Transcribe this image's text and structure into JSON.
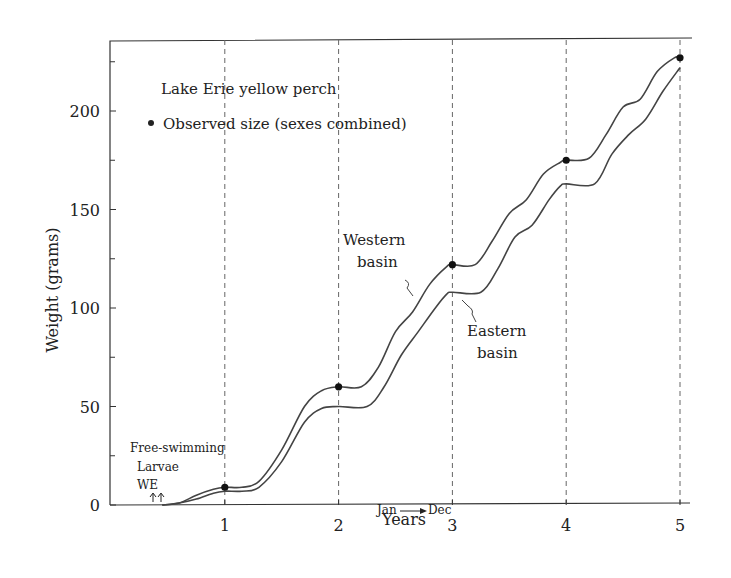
{
  "chart_data": {
    "type": "line",
    "title": "Lake Erie yellow perch",
    "legend": [
      {
        "marker": "filled-circle",
        "label": "Observed size (sexes combined)"
      }
    ],
    "xlabel": "Years",
    "ylabel": "Weight (grams)",
    "xlim": [
      0,
      5.1
    ],
    "ylim": [
      0,
      240
    ],
    "x_ticks": [
      1,
      2,
      3,
      4,
      5
    ],
    "y_ticks": [
      0,
      50,
      100,
      150,
      200
    ],
    "y_minor_ticks": [
      25,
      75,
      125,
      175,
      225
    ],
    "grid": "vertical dashed lines at each year",
    "series": [
      {
        "name": "Western basin",
        "x": [
          0.45,
          0.6,
          0.75,
          0.9,
          1.0,
          1.15,
          1.3,
          1.5,
          1.7,
          1.85,
          2.0,
          2.2,
          2.35,
          2.5,
          2.65,
          2.8,
          2.95,
          3.0,
          3.2,
          3.35,
          3.5,
          3.65,
          3.8,
          3.95,
          4.0,
          4.2,
          4.35,
          4.5,
          4.65,
          4.8,
          4.95,
          5.0
        ],
        "values": [
          0,
          1,
          5,
          8,
          9,
          9,
          12,
          28,
          50,
          58,
          60,
          60,
          70,
          88,
          98,
          112,
          121,
          122,
          122,
          134,
          148,
          155,
          168,
          174,
          175,
          176,
          188,
          202,
          206,
          220,
          227,
          227
        ]
      },
      {
        "name": "Eastern basin",
        "x": [
          0.45,
          0.6,
          0.75,
          0.9,
          1.0,
          1.15,
          1.3,
          1.5,
          1.7,
          1.85,
          2.0,
          2.25,
          2.4,
          2.55,
          2.7,
          2.85,
          2.95,
          3.0,
          3.25,
          3.4,
          3.55,
          3.7,
          3.85,
          3.95,
          4.0,
          4.25,
          4.4,
          4.55,
          4.7,
          4.85,
          5.0
        ],
        "values": [
          0,
          1,
          3,
          6,
          7,
          7,
          9,
          22,
          42,
          49,
          50,
          50,
          60,
          76,
          88,
          100,
          107,
          108,
          108,
          120,
          136,
          142,
          155,
          162,
          163,
          163,
          178,
          188,
          196,
          210,
          222
        ]
      }
    ],
    "observed_points": [
      {
        "x": 1,
        "y": 9
      },
      {
        "x": 2,
        "y": 60
      },
      {
        "x": 3,
        "y": 122
      },
      {
        "x": 4,
        "y": 175
      },
      {
        "x": 5,
        "y": 227
      }
    ],
    "annotations": [
      "Western basin",
      "Eastern basin",
      "Free-swimming",
      "Larvae",
      "WE",
      "Jan → Dec"
    ]
  },
  "labels": {
    "title": "Lake Erie yellow perch",
    "legend": "Observed size (sexes combined)",
    "xlabel": "Years",
    "ylabel": "Weight (grams)",
    "western": [
      "Western",
      "basin"
    ],
    "eastern": [
      "Eastern",
      "basin"
    ],
    "free_swimming": "Free-swimming",
    "larvae": "Larvae",
    "we": "WE",
    "jan": "Jan",
    "dec": "Dec"
  }
}
